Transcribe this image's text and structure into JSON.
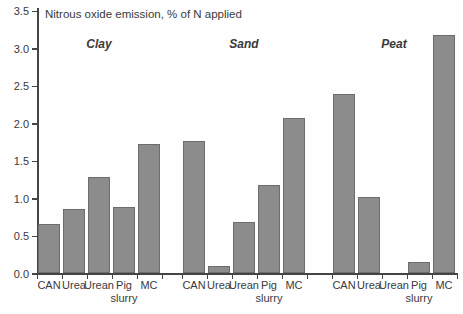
{
  "chart_data": {
    "type": "bar",
    "title": "Nitrous oxide emission, % of N applied",
    "ylabel": "Nitrous oxide emission, % of N applied",
    "xlabel": "",
    "ylim": [
      0,
      3.5
    ],
    "ytick_step": 0.5,
    "ytick_labels": [
      "0.0",
      "0.5",
      "1.0",
      "1.5",
      "2.0",
      "2.5",
      "3.0",
      "3.5"
    ],
    "grid": false,
    "legend": "none",
    "categories": [
      "CAN",
      "Urea",
      "Urean",
      "Pig slurry",
      "MC"
    ],
    "series": [
      {
        "name": "Clay",
        "values": [
          0.65,
          0.85,
          1.28,
          0.88,
          1.72
        ]
      },
      {
        "name": "Sand",
        "values": [
          1.76,
          0.1,
          0.68,
          1.17,
          2.07
        ]
      },
      {
        "name": "Peat",
        "values": [
          2.39,
          1.02,
          0.0,
          0.15,
          3.17
        ]
      }
    ],
    "bar_color": "#8c8c8c",
    "bar_border_color": "#6d6d6d",
    "axis_color": "#444444",
    "text_color": "#3a3a3a"
  }
}
